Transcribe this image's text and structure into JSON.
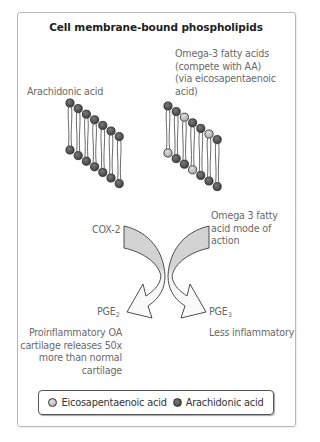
{
  "title": "Cell membrane-bound phospholipids",
  "left_membrane": {
    "label": "Arachidonic acid",
    "top_heads": [
      "arachidonic",
      "arachidonic",
      "arachidonic",
      "arachidonic",
      "arachidonic",
      "arachidonic",
      "arachidonic"
    ],
    "bottom_heads": [
      "arachidonic",
      "arachidonic",
      "arachidonic",
      "arachidonic",
      "arachidonic",
      "arachidonic",
      "arachidonic"
    ]
  },
  "right_membrane": {
    "label_lines": [
      "Omega-3 fatty acids",
      "(compete with AA)",
      "(via eicosapentaenoic",
      "acid)"
    ],
    "top_heads": [
      "arachidonic",
      "arachidonic",
      "eicosapentaenoic",
      "arachidonic",
      "arachidonic",
      "eicosapentaenoic",
      "arachidonic"
    ],
    "bottom_heads": [
      "eicosapentaenoic",
      "arachidonic",
      "arachidonic",
      "eicosapentaenoic",
      "arachidonic",
      "arachidonic",
      "arachidonic"
    ]
  },
  "arrows": {
    "left_enzyme": "COX-2",
    "right_action_lines": [
      "Omega 3 fatty",
      "acid mode of",
      "action"
    ],
    "left_product": {
      "base": "PGE",
      "sub": "2"
    },
    "right_product": {
      "base": "PGE",
      "sub": "3"
    },
    "left_outcome_lines": [
      "Proinflammatory OA",
      "cartilage releases 50x",
      "more than normal",
      "cartilage"
    ],
    "right_outcome": "Less inflammatory"
  },
  "legend": {
    "items": [
      {
        "label": "Eicosapentaenoic acid",
        "color": "#bdbdbd"
      },
      {
        "label": "Arachidonic acid",
        "color": "#4a4a4a"
      }
    ]
  },
  "colors": {
    "arachidonic": "#565656",
    "eicosapentaenoic": "#c2c2c2",
    "arrow_fill_top": "#d2d2d2",
    "arrow_fill_bottom": "#f7f7f7",
    "outline": "#3a3a3a"
  }
}
